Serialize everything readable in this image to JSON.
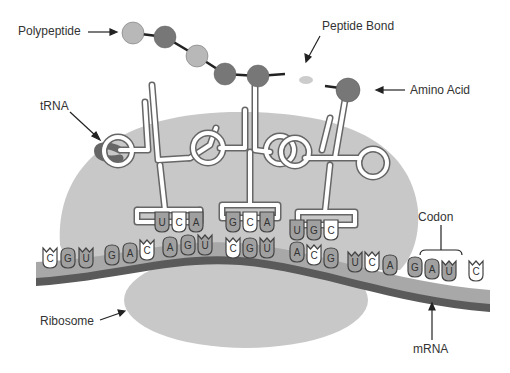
{
  "labels": {
    "polypeptide": "Polypeptide",
    "peptide_bond": "Peptide Bond",
    "amino_acid": "Amino Acid",
    "trna": "tRNA",
    "codon": "Codon",
    "ribosome": "Ribosome",
    "mrna": "mRNA"
  },
  "colors": {
    "ribosome": "#c8c8c8",
    "mrna_light": "#a8a8a8",
    "mrna_dark": "#5a5a5a",
    "amino_light": "#b8b8b8",
    "amino_dark": "#777777",
    "base_gray": "#a0a0a0",
    "base_white": "#ffffff"
  },
  "mrna_bases": [
    {
      "base": "C",
      "x": 50,
      "y": 258,
      "shape": "notch",
      "fill": "white"
    },
    {
      "base": "G",
      "x": 68,
      "y": 258,
      "shape": "round",
      "fill": "gray"
    },
    {
      "base": "U",
      "x": 86,
      "y": 258,
      "shape": "notch",
      "fill": "gray"
    },
    {
      "base": "G",
      "x": 112,
      "y": 255,
      "shape": "round",
      "fill": "gray"
    },
    {
      "base": "A",
      "x": 130,
      "y": 253,
      "shape": "round",
      "fill": "gray"
    },
    {
      "base": "C",
      "x": 147,
      "y": 250,
      "shape": "notch",
      "fill": "white"
    },
    {
      "base": "A",
      "x": 170,
      "y": 247,
      "shape": "round",
      "fill": "gray"
    },
    {
      "base": "G",
      "x": 188,
      "y": 245,
      "shape": "round",
      "fill": "gray"
    },
    {
      "base": "U",
      "x": 205,
      "y": 245,
      "shape": "notch",
      "fill": "gray"
    },
    {
      "base": "C",
      "x": 233,
      "y": 248,
      "shape": "notch",
      "fill": "white"
    },
    {
      "base": "G",
      "x": 250,
      "y": 248,
      "shape": "round",
      "fill": "gray"
    },
    {
      "base": "U",
      "x": 267,
      "y": 248,
      "shape": "notch",
      "fill": "gray"
    },
    {
      "base": "A",
      "x": 297,
      "y": 252,
      "shape": "round",
      "fill": "gray"
    },
    {
      "base": "C",
      "x": 314,
      "y": 255,
      "shape": "notch",
      "fill": "white"
    },
    {
      "base": "G",
      "x": 331,
      "y": 258,
      "shape": "round",
      "fill": "gray"
    },
    {
      "base": "U",
      "x": 355,
      "y": 262,
      "shape": "notch",
      "fill": "gray"
    },
    {
      "base": "C",
      "x": 372,
      "y": 262,
      "shape": "notch",
      "fill": "white"
    },
    {
      "base": "A",
      "x": 390,
      "y": 265,
      "shape": "round",
      "fill": "gray"
    },
    {
      "base": "G",
      "x": 415,
      "y": 267,
      "shape": "round",
      "fill": "gray"
    },
    {
      "base": "A",
      "x": 432,
      "y": 269,
      "shape": "round",
      "fill": "gray"
    },
    {
      "base": "U",
      "x": 449,
      "y": 271,
      "shape": "notch",
      "fill": "gray"
    },
    {
      "base": "C",
      "x": 476,
      "y": 271,
      "shape": "notch",
      "fill": "white"
    }
  ],
  "trna_anticodons": [
    {
      "bases": [
        "U",
        "C",
        "A"
      ],
      "fills": [
        "gray",
        "white",
        "gray"
      ],
      "x": 162,
      "y": 222
    },
    {
      "bases": [
        "G",
        "C",
        "A"
      ],
      "fills": [
        "gray",
        "white",
        "gray"
      ],
      "x": 233,
      "y": 222
    },
    {
      "bases": [
        "U",
        "G",
        "C"
      ],
      "fills": [
        "gray",
        "gray",
        "white"
      ],
      "x": 297,
      "y": 230
    }
  ],
  "polypeptide_beads": [
    {
      "x": 133,
      "y": 33,
      "r": 11,
      "tone": "light"
    },
    {
      "x": 165,
      "y": 37,
      "r": 11,
      "tone": "dark"
    },
    {
      "x": 197,
      "y": 56,
      "r": 11,
      "tone": "light"
    },
    {
      "x": 225,
      "y": 74,
      "r": 11,
      "tone": "dark"
    },
    {
      "x": 258,
      "y": 76,
      "r": 11,
      "tone": "dark"
    }
  ],
  "amino_acid": {
    "x": 348,
    "y": 90,
    "r": 12
  }
}
